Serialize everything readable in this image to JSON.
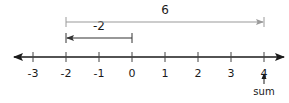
{
  "number_line": {
    "min": -3,
    "max": 4,
    "ticks": [
      -3,
      -2,
      -1,
      0,
      1,
      2,
      3,
      4
    ],
    "tick_labels": [
      "-3",
      "-2",
      "-1",
      "0",
      "1",
      "2",
      "3",
      "4"
    ],
    "arrows_both_ends": true,
    "axis_color": "#1a1a1a"
  },
  "jumps": [
    {
      "name": "jump-negative-two",
      "from": 0,
      "to": -2,
      "label": "-2",
      "color": "#333333"
    },
    {
      "name": "jump-six",
      "from": -2,
      "to": 4,
      "label": "6",
      "color": "#9a9a9a"
    }
  ],
  "sum_marker": {
    "at": 4,
    "label": "sum"
  }
}
